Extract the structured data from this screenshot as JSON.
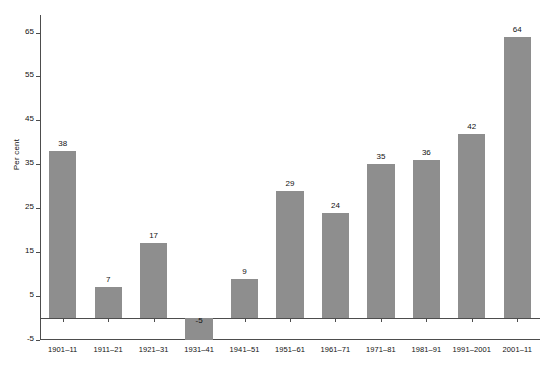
{
  "chart_data": {
    "type": "bar",
    "title": "",
    "subtitle": "",
    "xlabel": "",
    "ylabel": "Per cent",
    "categories": [
      "1901–11",
      "1911–21",
      "1921–31",
      "1931–41",
      "1941–51",
      "1951–61",
      "1961–71",
      "1971–81",
      "1981–91",
      "1991–2001",
      "2001–11"
    ],
    "values": [
      38,
      7,
      17,
      -5,
      9,
      29,
      24,
      35,
      36,
      42,
      64
    ],
    "value_labels": [
      "38",
      "7",
      "17",
      "-5",
      "9",
      "29",
      "24",
      "35",
      "36",
      "42",
      "64"
    ],
    "ylim": [
      -5,
      69
    ],
    "ytick_values": [
      -5,
      5,
      15,
      25,
      35,
      45,
      55,
      65
    ],
    "ytick_labels": [
      "-5",
      "5",
      "15",
      "25",
      "35",
      "45",
      "55",
      "65"
    ],
    "grid": false,
    "legend": null,
    "legend_position": "none",
    "bar_color": "#8e8e8e",
    "axis_color": "#4d4d4d",
    "background_color": "#ffffff"
  }
}
